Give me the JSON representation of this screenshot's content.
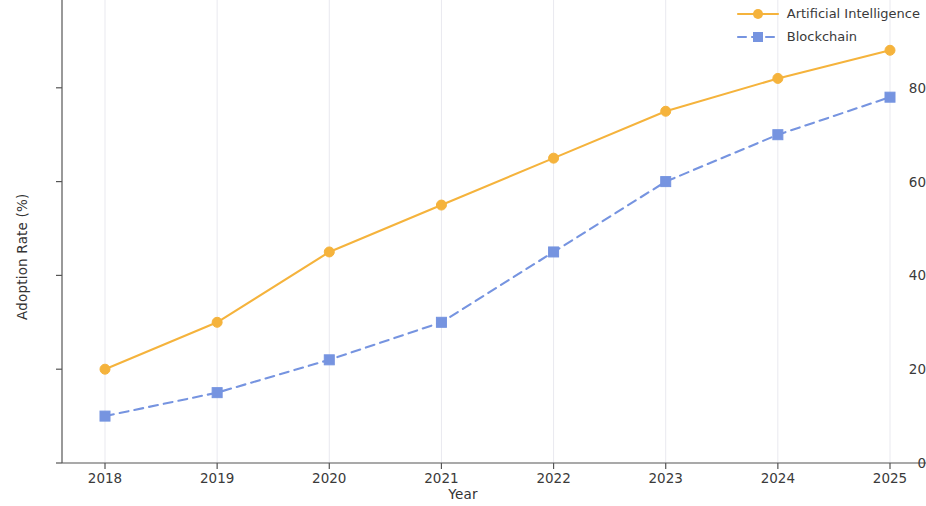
{
  "chart_data": {
    "type": "line",
    "title": "",
    "xlabel": "Year",
    "ylabel": "Adoption Rate (%)",
    "categories": [
      "2018",
      "2019",
      "2020",
      "2021",
      "2022",
      "2023",
      "2024",
      "2025"
    ],
    "x": [
      2018,
      2019,
      2020,
      2021,
      2022,
      2023,
      2024,
      2025
    ],
    "xlim": [
      2018,
      2025
    ],
    "ylim": [
      0,
      100
    ],
    "yticks": [
      0,
      20,
      40,
      60,
      80,
      100
    ],
    "ytick_labels": [
      "0",
      "20",
      "40",
      "60",
      "80",
      "100"
    ],
    "xticks": [
      2018,
      2019,
      2020,
      2021,
      2022,
      2023,
      2024,
      2025
    ],
    "grid": "faint vertical gridlines only",
    "legend_position": "top-right",
    "series": [
      {
        "name": "Artificial Intelligence",
        "values": [
          20,
          30,
          45,
          55,
          65,
          75,
          82,
          88
        ],
        "color": "#f5b33c",
        "linestyle": "solid",
        "marker": "circle"
      },
      {
        "name": "Blockchain",
        "values": [
          10,
          15,
          22,
          30,
          45,
          60,
          70,
          78
        ],
        "color": "#7694e0",
        "linestyle": "dashed",
        "marker": "square"
      }
    ]
  },
  "axes": {
    "x_title": "Year",
    "y_title": "Adoption Rate (%)"
  },
  "legend": {
    "items": [
      {
        "label": "Artificial Intelligence",
        "color": "#f5b33c",
        "style": "solid",
        "marker": "circle"
      },
      {
        "label": "Blockchain",
        "color": "#7694e0",
        "style": "dashed",
        "marker": "square"
      }
    ]
  }
}
